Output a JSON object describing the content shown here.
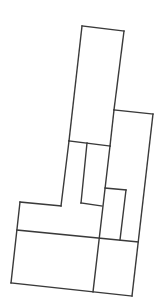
{
  "diagram": {
    "type": "floor-plan-outline",
    "stroke_color": "#3a3a3a",
    "background": "#ffffff",
    "segments": [
      {
        "id": "tower-top",
        "points": [
          [
            82,
            26
          ],
          [
            124,
            31
          ]
        ]
      },
      {
        "id": "tower-left",
        "points": [
          [
            82,
            26
          ],
          [
            69,
            141
          ]
        ]
      },
      {
        "id": "tower-right",
        "points": [
          [
            124,
            31
          ],
          [
            114,
            110
          ]
        ]
      },
      {
        "id": "tower-right-lower",
        "points": [
          [
            114,
            110
          ],
          [
            110,
            146
          ]
        ]
      },
      {
        "id": "tower-bottom",
        "points": [
          [
            69,
            141
          ],
          [
            110,
            146
          ]
        ]
      },
      {
        "id": "right-block-top",
        "points": [
          [
            114,
            110
          ],
          [
            153,
            114
          ]
        ]
      },
      {
        "id": "right-block-right",
        "points": [
          [
            153,
            114
          ],
          [
            132,
            296
          ]
        ]
      },
      {
        "id": "corridor-left",
        "points": [
          [
            69,
            141
          ],
          [
            61,
            206
          ]
        ]
      },
      {
        "id": "corridor-mid",
        "points": [
          [
            87,
            143
          ],
          [
            81,
            203
          ]
        ]
      },
      {
        "id": "left-wing-top",
        "points": [
          [
            20,
            202
          ],
          [
            61,
            206
          ]
        ]
      },
      {
        "id": "mid-notch-top",
        "points": [
          [
            81,
            203
          ],
          [
            102,
            206
          ]
        ]
      },
      {
        "id": "inner-spine",
        "points": [
          [
            110,
            146
          ],
          [
            93,
            292
          ]
        ]
      },
      {
        "id": "small-room-top",
        "points": [
          [
            105,
            188
          ],
          [
            126,
            190
          ]
        ]
      },
      {
        "id": "small-room-right",
        "points": [
          [
            126,
            190
          ],
          [
            120,
            240
          ]
        ]
      },
      {
        "id": "left-wing-left",
        "points": [
          [
            20,
            202
          ],
          [
            11,
            283
          ]
        ]
      },
      {
        "id": "cross-wall",
        "points": [
          [
            17,
            230
          ],
          [
            138,
            242
          ]
        ]
      },
      {
        "id": "bottom-wall",
        "points": [
          [
            11,
            283
          ],
          [
            132,
            296
          ]
        ]
      }
    ]
  }
}
